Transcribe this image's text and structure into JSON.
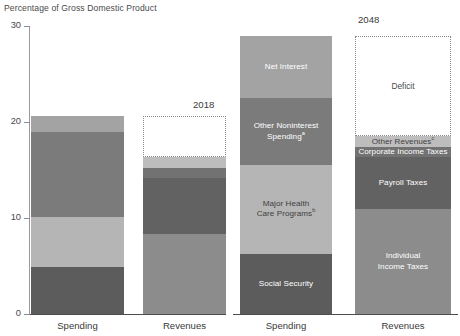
{
  "chart_data": {
    "type": "bar",
    "subtype": "stacked-bar",
    "title": "Percentage of Gross Domestic Product",
    "xlabel": "",
    "ylabel": "Percentage of Gross Domestic Product",
    "ylim": [
      0,
      30
    ],
    "yticks": [
      0,
      10,
      20,
      30
    ],
    "ytick_labels": [
      "0",
      "10",
      "20",
      "30"
    ],
    "grid": false,
    "legend": "none (in-bar labels)",
    "group_labels": [
      "2018",
      "2048"
    ],
    "categories": [
      "Spending",
      "Revenues",
      "Spending",
      "Revenues"
    ],
    "groups": [
      {
        "year": "2018",
        "bars": [
          {
            "category": "Spending",
            "total": 20.6,
            "segments": [
              {
                "name": "Social Security",
                "value": 4.9,
                "label": "",
                "color": "#5c5c5c"
              },
              {
                "name": "Major Health Care Programs",
                "value": 5.2,
                "label": "",
                "color": "#b5b5b5"
              },
              {
                "name": "Other Noninterest Spending",
                "value": 8.9,
                "label": "",
                "color": "#7b7b7b"
              },
              {
                "name": "Net Interest",
                "value": 1.6,
                "label": "",
                "color": "#a3a3a3"
              }
            ]
          },
          {
            "category": "Revenues",
            "total": 16.4,
            "deficit": 4.2,
            "deficit_top": 20.6,
            "deficit_label": "",
            "segments": [
              {
                "name": "Individual Income Taxes",
                "value": 8.3,
                "label": "",
                "color": "#8c8c8c"
              },
              {
                "name": "Payroll Taxes",
                "value": 5.9,
                "label": "",
                "color": "#626262"
              },
              {
                "name": "Corporate Income Taxes",
                "value": 1.0,
                "label": "",
                "color": "#727272"
              },
              {
                "name": "Other Revenues",
                "value": 1.2,
                "label": "",
                "color": "#bdbdbd"
              }
            ]
          }
        ]
      },
      {
        "year": "2048",
        "bars": [
          {
            "category": "Spending",
            "total": 29.0,
            "segments": [
              {
                "name": "Social Security",
                "value": 6.3,
                "label": "Social Security",
                "color": "#5c5c5c"
              },
              {
                "name": "Major Health Care Programs",
                "value": 9.2,
                "label": "Major Health\nCare Programs",
                "footnote": "b",
                "color": "#b5b5b5"
              },
              {
                "name": "Other Noninterest Spending",
                "value": 7.0,
                "label": "Other Noninterest\nSpending",
                "footnote": "a",
                "color": "#7b7b7b"
              },
              {
                "name": "Net Interest",
                "value": 6.5,
                "label": "Net Interest",
                "color": "#a3a3a3"
              }
            ]
          },
          {
            "category": "Revenues",
            "total": 18.5,
            "deficit": 10.5,
            "deficit_top": 29.0,
            "deficit_label": "Deficit",
            "segments": [
              {
                "name": "Individual Income Taxes",
                "value": 10.9,
                "label": "Individual\nIncome Taxes",
                "color": "#8c8c8c"
              },
              {
                "name": "Payroll Taxes",
                "value": 5.5,
                "label": "Payroll Taxes",
                "color": "#626262"
              },
              {
                "name": "Corporate Income Taxes",
                "value": 1.0,
                "label": "Corporate Income Taxes",
                "color": "#727272"
              },
              {
                "name": "Other Revenues",
                "value": 1.1,
                "label": "Other Revenues",
                "footnote": "c",
                "color": "#bdbdbd"
              }
            ]
          }
        ]
      }
    ],
    "colors": {
      "social_security": "#5c5c5c",
      "major_health": "#b5b5b5",
      "other_noninterest": "#7b7b7b",
      "net_interest": "#a3a3a3",
      "individual_income_taxes": "#8c8c8c",
      "payroll_taxes": "#626262",
      "corporate_income_taxes": "#727272",
      "other_revenues": "#bdbdbd",
      "axis": "#4d4d4d",
      "text": "#3a3a3a",
      "deficit_border": "#8a8a8a"
    }
  }
}
